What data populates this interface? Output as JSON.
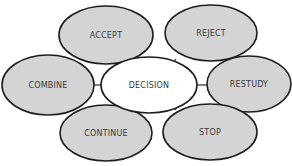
{
  "diagram": {
    "center": {
      "id": "decision",
      "label": "DECISION",
      "cx": 149,
      "cy": 85,
      "rx": 48,
      "ry": 28
    },
    "outcomes": [
      {
        "id": "accept",
        "label": "ACCEPT",
        "cx": 106,
        "cy": 35,
        "rx": 47,
        "ry": 29,
        "edge": [
          128,
          60,
          132,
          65
        ]
      },
      {
        "id": "reject",
        "label": "REJECT",
        "cx": 211,
        "cy": 33,
        "rx": 46,
        "ry": 28,
        "edge": [
          176,
          59,
          172,
          64
        ]
      },
      {
        "id": "combine",
        "label": "COMBINE",
        "cx": 48,
        "cy": 85,
        "rx": 46,
        "ry": 30,
        "edge": [
          94,
          85,
          101,
          85
        ]
      },
      {
        "id": "restudy",
        "label": "RESTUDY",
        "cx": 249,
        "cy": 84,
        "rx": 42,
        "ry": 28,
        "edge": [
          197,
          85,
          207,
          85
        ]
      },
      {
        "id": "continue",
        "label": "CONTINUE",
        "cx": 106,
        "cy": 133,
        "rx": 46,
        "ry": 28,
        "edge": [
          121,
          107,
          125,
          110
        ]
      },
      {
        "id": "stop",
        "label": "STOP",
        "cx": 210,
        "cy": 132,
        "rx": 47,
        "ry": 28,
        "edge": [
          178,
          106,
          175,
          110
        ]
      }
    ]
  },
  "colors": {
    "outcome_fill": "#d4d4d4",
    "center_fill": "#ffffff",
    "stroke": "#1e1e1e",
    "text": "#3a3a3a"
  }
}
